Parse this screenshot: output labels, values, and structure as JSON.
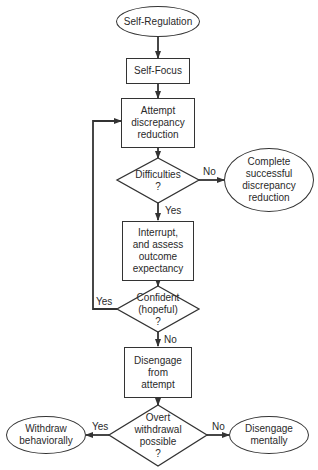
{
  "diagram": {
    "type": "flowchart",
    "nodes": {
      "start": {
        "shape": "ellipse",
        "label": "Self-Regulation"
      },
      "self_focus": {
        "shape": "rect",
        "label": "Self-Focus"
      },
      "attempt": {
        "shape": "rect",
        "label": "Attempt\ndiscrepancy\nreduction"
      },
      "difficulties": {
        "shape": "diamond",
        "label": "Difficulties\n?"
      },
      "complete": {
        "shape": "ellipse",
        "label": "Complete\nsuccessful\ndiscrepancy\nreduction"
      },
      "interrupt": {
        "shape": "rect",
        "label": "Interrupt,\nand assess\noutcome\nexpectancy"
      },
      "confident": {
        "shape": "diamond",
        "label": "Confident\n(hopeful)\n?"
      },
      "disengage_attempt": {
        "shape": "rect",
        "label": "Disengage\nfrom\nattempt"
      },
      "overt": {
        "shape": "diamond",
        "label": "Overt\nwithdrawal\npossible\n?"
      },
      "withdraw": {
        "shape": "ellipse",
        "label": "Withdraw\nbehaviorally"
      },
      "disengage_mentally": {
        "shape": "ellipse",
        "label": "Disengage\nmentally"
      }
    },
    "edge_labels": {
      "difficulties_no": "No",
      "difficulties_yes": "Yes",
      "confident_yes": "Yes",
      "confident_no": "No",
      "overt_yes": "Yes",
      "overt_no": "No"
    },
    "edges": [
      {
        "from": "start",
        "to": "self_focus"
      },
      {
        "from": "self_focus",
        "to": "attempt"
      },
      {
        "from": "attempt",
        "to": "difficulties"
      },
      {
        "from": "difficulties",
        "to": "complete",
        "label": "No"
      },
      {
        "from": "difficulties",
        "to": "interrupt",
        "label": "Yes"
      },
      {
        "from": "interrupt",
        "to": "confident"
      },
      {
        "from": "confident",
        "to": "attempt",
        "label": "Yes"
      },
      {
        "from": "confident",
        "to": "disengage_attempt",
        "label": "No"
      },
      {
        "from": "disengage_attempt",
        "to": "overt"
      },
      {
        "from": "overt",
        "to": "withdraw",
        "label": "Yes"
      },
      {
        "from": "overt",
        "to": "disengage_mentally",
        "label": "No"
      }
    ],
    "colors": {
      "stroke": "#333333",
      "text": "#2a2a2a",
      "background": "#ffffff"
    }
  }
}
